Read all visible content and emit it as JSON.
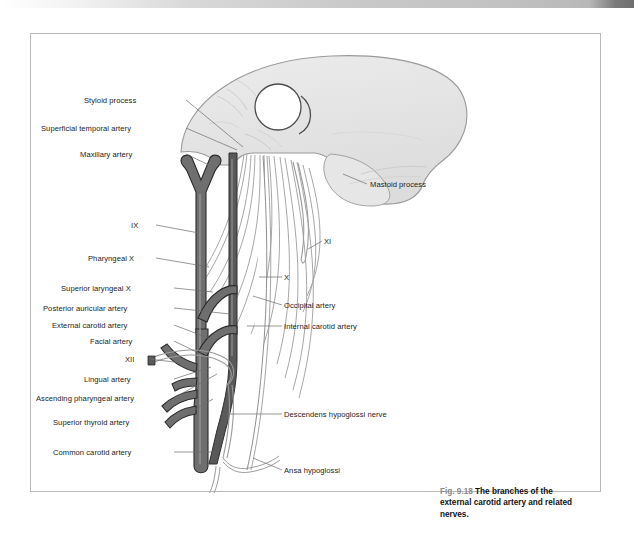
{
  "page": {
    "background": "#ffffff",
    "frame_border_color": "#b9b9b9"
  },
  "top_bar": {
    "name": "page-header-gradient-bar"
  },
  "figure": {
    "number": "Fig. 9.18",
    "caption": "The branches of the external carotid artery and related nerves.",
    "colors": {
      "artery_fill": "#6f6f6f",
      "artery_stroke": "#2a2a2a",
      "internal_carotid_fill": "#545454",
      "bone_fill": "#e3e3e3",
      "bone_stroke": "#9a9a9a",
      "nerve_fill": "#ffffff",
      "nerve_stroke": "#9d9d9d",
      "leader_line": "#6b6b6b",
      "label_text": "#1c1c1c",
      "fignum_text": "#8a8a8a"
    }
  },
  "labels_left": [
    {
      "id": "styloid-process",
      "text": "Styloid process",
      "x": 53,
      "y": 62,
      "lx": 155,
      "ly": 66,
      "tx": 212,
      "ty": 113
    },
    {
      "id": "superficial-temporal-artery",
      "text": "Superficial temporal artery",
      "x": 10,
      "y": 90,
      "lx": 155,
      "ly": 94,
      "tx": 206,
      "ty": 116
    },
    {
      "id": "maxillary-artery",
      "text": "Maxillary artery",
      "x": 49,
      "y": 116,
      "lx": 155,
      "ly": 120,
      "tx": 184,
      "ty": 134
    },
    {
      "id": "nerve-ix",
      "text": "IX",
      "x": 100,
      "y": 187,
      "lx": 125,
      "ly": 191,
      "tx": 168,
      "ty": 199
    },
    {
      "id": "pharyngeal-x",
      "text": "Pharyngeal X",
      "x": 57,
      "y": 220,
      "lx": 125,
      "ly": 224,
      "tx": 178,
      "ty": 233
    },
    {
      "id": "superior-laryngeal-x",
      "text": "Superior laryngeal X",
      "x": 30,
      "y": 250,
      "lx": 143,
      "ly": 254,
      "tx": 182,
      "ty": 258
    },
    {
      "id": "posterior-auricular-artery",
      "text": "Posterior auricular artery",
      "x": 12,
      "y": 270,
      "lx": 143,
      "ly": 274,
      "tx": 199,
      "ty": 280
    },
    {
      "id": "external-carotid-artery",
      "text": "External carotid artery",
      "x": 21,
      "y": 287,
      "lx": 143,
      "ly": 291,
      "tx": 180,
      "ty": 305
    },
    {
      "id": "facial-artery",
      "text": "Facial artery",
      "x": 59,
      "y": 303,
      "lx": 143,
      "ly": 307,
      "tx": 172,
      "ty": 321
    },
    {
      "id": "nerve-xii",
      "text": "XII",
      "x": 94,
      "y": 321,
      "lx": 118,
      "ly": 325,
      "tx": 152,
      "ty": 329
    },
    {
      "id": "lingual-artery",
      "text": "Lingual artery",
      "x": 53,
      "y": 341,
      "lx": 143,
      "ly": 345,
      "tx": 180,
      "ty": 333
    },
    {
      "id": "ascending-pharyngeal-artery",
      "text": "Ascending pharyngeal artery",
      "x": 5,
      "y": 360,
      "lx": 143,
      "ly": 364,
      "tx": 186,
      "ty": 340
    },
    {
      "id": "superior-thyroid-artery",
      "text": "Superior thyroid artery",
      "x": 22,
      "y": 384,
      "lx": 143,
      "ly": 388,
      "tx": 182,
      "ty": 365
    },
    {
      "id": "common-carotid-artery",
      "text": "Common carotid artery",
      "x": 22,
      "y": 414,
      "lx": 143,
      "ly": 418,
      "tx": 182,
      "ty": 418
    }
  ],
  "labels_right": [
    {
      "id": "mastoid-process",
      "text": "Mastoid process",
      "x": 339,
      "y": 146,
      "lx": 336,
      "ly": 150,
      "tx": 312,
      "ty": 140
    },
    {
      "id": "nerve-xi",
      "text": "XI",
      "x": 293,
      "y": 203,
      "lx": 291,
      "ly": 207,
      "tx": 277,
      "ty": 215
    },
    {
      "id": "nerve-x",
      "text": "X",
      "x": 253,
      "y": 239,
      "lx": 251,
      "ly": 243,
      "tx": 228,
      "ty": 243
    },
    {
      "id": "occipital-artery",
      "text": "Occipital artery",
      "x": 253,
      "y": 267,
      "lx": 251,
      "ly": 271,
      "tx": 222,
      "ty": 262
    },
    {
      "id": "internal-carotid-artery",
      "text": "Internal carotid artery",
      "x": 253,
      "y": 288,
      "lx": 251,
      "ly": 292,
      "tx": 216,
      "ty": 292
    },
    {
      "id": "descendens-hypoglossi",
      "text": "Descendens hypoglossi nerve",
      "x": 253,
      "y": 376,
      "lx": 251,
      "ly": 380,
      "tx": 196,
      "ty": 380
    },
    {
      "id": "ansa-hypoglossi",
      "text": "Ansa hypoglossi",
      "x": 253,
      "y": 432,
      "lx": 251,
      "ly": 436,
      "tx": 222,
      "ty": 424
    }
  ]
}
